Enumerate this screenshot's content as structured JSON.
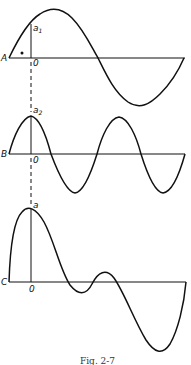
{
  "figure": {
    "caption": "Fig. 2-7",
    "panels": [
      {
        "id": "A",
        "label": "A",
        "origin_label": "0",
        "peak_label": "a",
        "peak_subscript": "1",
        "marker": "∘",
        "description": "single sine wave, one full cycle, shifted so origin lies on rising slope"
      },
      {
        "id": "B",
        "label": "B",
        "origin_label": "0",
        "peak_label": "a",
        "peak_subscript": "2",
        "description": "sine wave of twice the frequency, peak at origin"
      },
      {
        "id": "C",
        "label": "C",
        "origin_label": "0",
        "peak_label": "a",
        "peak_subscript": "",
        "description": "resultant (sum of A and B) complex waveform"
      }
    ]
  },
  "colors": {
    "stroke": "#111111",
    "background": "#ffffff"
  }
}
